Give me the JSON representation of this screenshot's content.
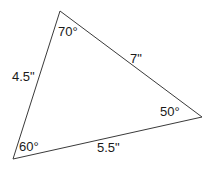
{
  "figure": {
    "type": "triangle-diagram",
    "background_color": "#ffffff",
    "stroke_color": "#3a3a3a",
    "text_color": "#1a1a1a",
    "vertices": {
      "top": {
        "x": 60,
        "y": 11
      },
      "bottom_left": {
        "x": 13,
        "y": 159
      },
      "right": {
        "x": 202,
        "y": 117
      }
    },
    "angles": {
      "top": "70°",
      "bottom_left": "60°",
      "right": "50°"
    },
    "sides": {
      "left": "4.5\"",
      "top_right": "7\"",
      "bottom": "5.5\""
    }
  }
}
